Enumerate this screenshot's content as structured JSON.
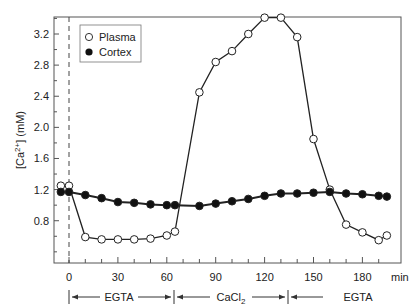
{
  "chart_data": {
    "type": "line",
    "title": "",
    "xlabel": "min",
    "ylabel": "[Ca2+] (mM)",
    "xlim": [
      -8,
      200
    ],
    "ylim": [
      0.3,
      3.4
    ],
    "x_ticks": [
      0,
      30,
      60,
      90,
      120,
      150,
      180
    ],
    "y_ticks": [
      0.8,
      1.2,
      1.6,
      2.0,
      2.4,
      2.8,
      3.2
    ],
    "grid": false,
    "legend_position": "upper-left",
    "reference_line": {
      "x": 0,
      "style": "dashed"
    },
    "series": [
      {
        "name": "Plasma",
        "marker": "open-circle",
        "x": [
          -5,
          0,
          10,
          20,
          30,
          40,
          50,
          60,
          65,
          80,
          90,
          100,
          110,
          120,
          130,
          140,
          150,
          160,
          170,
          180,
          190,
          195
        ],
        "values": [
          1.25,
          1.25,
          0.59,
          0.56,
          0.56,
          0.56,
          0.57,
          0.61,
          0.66,
          2.45,
          2.84,
          2.98,
          3.2,
          3.41,
          3.41,
          3.16,
          1.85,
          1.2,
          0.75,
          0.65,
          0.55,
          0.61
        ]
      },
      {
        "name": "Cortex",
        "marker": "filled-circle",
        "x": [
          -5,
          0,
          10,
          20,
          30,
          40,
          50,
          60,
          65,
          80,
          90,
          100,
          110,
          120,
          130,
          140,
          150,
          160,
          170,
          180,
          190,
          195
        ],
        "values": [
          1.17,
          1.17,
          1.13,
          1.09,
          1.04,
          1.03,
          1.01,
          1.0,
          1.0,
          0.99,
          1.02,
          1.05,
          1.08,
          1.12,
          1.15,
          1.15,
          1.16,
          1.17,
          1.15,
          1.14,
          1.12,
          1.11
        ]
      }
    ],
    "annotations": [
      {
        "label": "EGTA",
        "from": 0,
        "to": 65
      },
      {
        "label": "CaCl2",
        "from": 65,
        "to": 135
      },
      {
        "label": "EGTA",
        "from": 135,
        "to": 200
      }
    ]
  },
  "labels": {
    "ylabel_main": "[Ca",
    "ylabel_sup": "2+",
    "ylabel_tail": "] (mM)",
    "x_unit": "min",
    "legend_plasma": "Plasma",
    "legend_cortex": "Cortex",
    "ann1": "EGTA",
    "ann2_main": "CaCl",
    "ann2_sub": "2",
    "ann3": "EGTA"
  }
}
